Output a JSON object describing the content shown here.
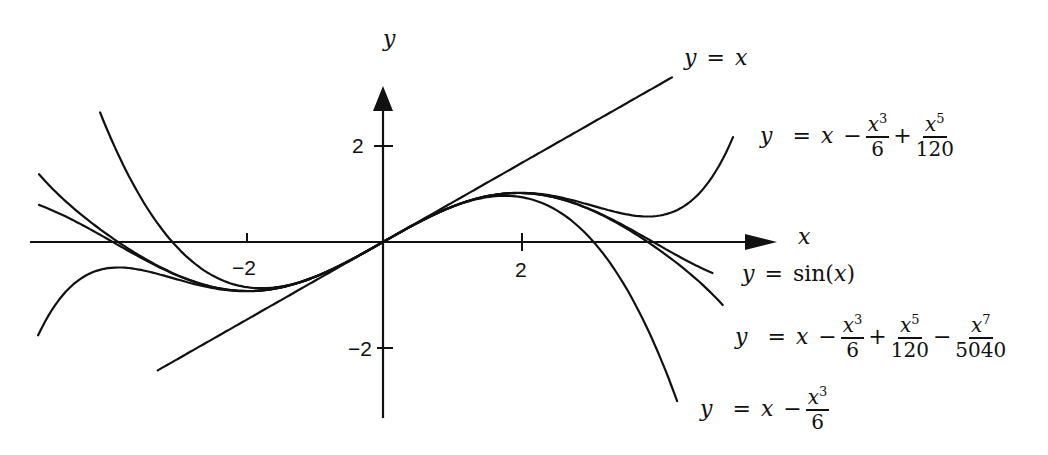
{
  "chart_data": {
    "type": "line",
    "title": "",
    "xlabel": "x",
    "ylabel": "y",
    "x_ticks": [
      {
        "value": -2,
        "label": "-2"
      },
      {
        "value": 2,
        "label": "2"
      }
    ],
    "y_ticks": [
      {
        "value": 2,
        "label": "2"
      },
      {
        "value": -2,
        "label": "-2"
      }
    ],
    "xlim": [
      -4.0,
      4.5
    ],
    "ylim": [
      -3.5,
      3.8
    ],
    "grid": false,
    "legend": "inline labels next to curves",
    "series": [
      {
        "name": "y = x",
        "formula": "x",
        "x_range": [
          -2.62,
          3.36
        ]
      },
      {
        "name": "y = x - x^3/6",
        "formula": "x - x^3/6",
        "x_range": [
          -3.29,
          3.42
        ]
      },
      {
        "name": "y = x - x^3/6 + x^5/120",
        "formula": "x - x^3/6 + x^5/120",
        "x_range": [
          -4.01,
          4.07
        ]
      },
      {
        "name": "y = x - x^3/6 + x^5/120 - x^7/5040",
        "formula": "x - x^3/6 + x^5/120 - x^7/5040",
        "x_range": [
          -4.0,
          3.95
        ]
      },
      {
        "name": "y = sin(x)",
        "formula": "sin(x)",
        "x_range": [
          -4.0,
          3.83
        ]
      }
    ]
  },
  "axes": {
    "x_label": "x",
    "y_label": "y",
    "tick_x_neg": "−2",
    "tick_x_pos": "2",
    "tick_y_pos": "2",
    "tick_y_neg": "−2"
  },
  "labels": {
    "linear": {
      "lhs": "y",
      "eq": "=",
      "rhs": "x"
    },
    "fifth": {
      "lhs": "y",
      "eq": "=",
      "x": "x",
      "minus": "−",
      "plus": "+",
      "f1_num": "x",
      "f1_exp": "3",
      "f1_den": "6",
      "f2_num": "x",
      "f2_exp": "5",
      "f2_den": "120"
    },
    "sine": {
      "lhs": "y",
      "eq": "=",
      "fn": "sin(",
      "arg": "x",
      "close": " )"
    },
    "seventh": {
      "lhs": "y",
      "eq": "=",
      "x": "x",
      "minus": "−",
      "plus": "+",
      "minus2": "−",
      "f1_num": "x",
      "f1_exp": "3",
      "f1_den": "6",
      "f2_num": "x",
      "f2_exp": "5",
      "f2_den": "120",
      "f3_num": "x",
      "f3_exp": "7",
      "f3_den": "5040"
    },
    "cubic": {
      "lhs": "y",
      "eq": "=",
      "x": "x",
      "minus": "−",
      "f1_num": "x",
      "f1_exp": "3",
      "f1_den": "6"
    }
  },
  "layout": {
    "origin_px": [
      383,
      242
    ],
    "x_scale": 86,
    "y_scale": 49,
    "stroke": "#111111"
  }
}
